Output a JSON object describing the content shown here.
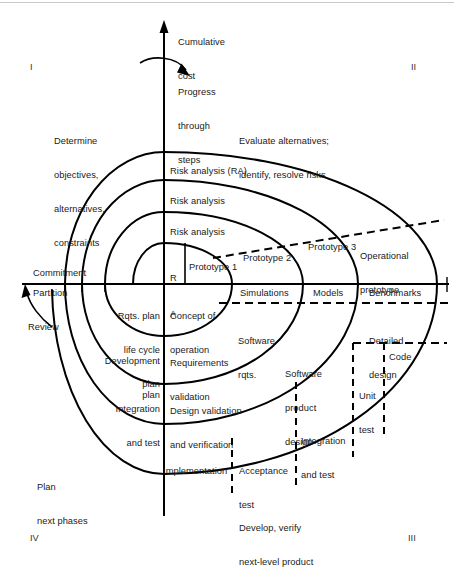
{
  "figure": {
    "axes": {
      "vertical_label": "Cumulative\ncost",
      "vertical_label_line1": "Cumulative",
      "vertical_label_line2": "cost",
      "progress_label_line1": "Progress",
      "progress_label_line2": "through",
      "progress_label_line3": "steps"
    },
    "quadrants": [
      {
        "id": "I",
        "numeral": "I",
        "position": "top-left"
      },
      {
        "id": "II",
        "numeral": "II",
        "position": "top-right"
      },
      {
        "id": "III",
        "numeral": "III",
        "position": "bottom-right"
      },
      {
        "id": "IV",
        "numeral": "IV",
        "position": "bottom-left"
      }
    ],
    "quadrant_descriptions": {
      "q1_line1": "Determine",
      "q1_line2": "objectives,",
      "q1_line3": "alternatives,",
      "q1_line4": "constraints",
      "q2_line1": "Evaluate alternatives;",
      "q2_line2": "identify, resolve risks",
      "q3_line1": "Develop, verify",
      "q3_line2": "next-level product",
      "q4_line1": "Plan",
      "q4_line2": "next phases"
    },
    "risk_labels": [
      "Risk analysis (RA)",
      "Risk analysis",
      "Risk analysis"
    ],
    "ra_small_line1": "R",
    "ra_small_line2": "A",
    "prototypes": [
      "Prototype 1",
      "Prototype 2",
      "Prototype 3"
    ],
    "operational_prototype_line1": "Operational",
    "operational_prototype_line2": "prototype",
    "axis_band_labels": [
      "Rqts. plan",
      "life cycle",
      "plan",
      "Concept of",
      "operation",
      "Simulations",
      "Models",
      "Benchmarks"
    ],
    "left_axis_labels": {
      "commitment": "Commitment",
      "partition": "Partition",
      "review": "Review"
    },
    "plan_labels": {
      "rqts_plan_l1": "Rqts. plan",
      "rqts_plan_l2": "life cycle",
      "rqts_plan_l3": "plan",
      "development_l1": "Development",
      "development_l2": "plan",
      "integration_l1": "Integration",
      "integration_l2": "and test"
    },
    "engineering_labels": {
      "concept_l1": "Concept of",
      "concept_l2": "operation",
      "software_rqts_l1": "Software",
      "software_rqts_l2": "rqts.",
      "requirements_validation_l1": "Requirements",
      "requirements_validation_l2": "validation",
      "software_product_design_l1": "Software",
      "software_product_design_l2": "product",
      "software_product_design_l3": "design",
      "detailed_design_l1": "Detailed",
      "detailed_design_l2": "design",
      "design_validation_l1": "Design validation",
      "design_validation_l2": "and verification",
      "code": "Code",
      "unit_test_l1": "Unit",
      "unit_test_l2": "test",
      "integration_and_test_l1": "Integration",
      "integration_and_test_l2": "and test",
      "acceptance_test_l1": "Acceptance",
      "acceptance_test_l2": "test",
      "implementation": "Implementation",
      "simulations": "Simulations",
      "models": "Models",
      "benchmarks": "Benchmarks"
    },
    "colors": {
      "stroke": "#000000",
      "text": "#1a1a1a",
      "background": "#ffffff",
      "rule": "#c9c9c9"
    }
  }
}
